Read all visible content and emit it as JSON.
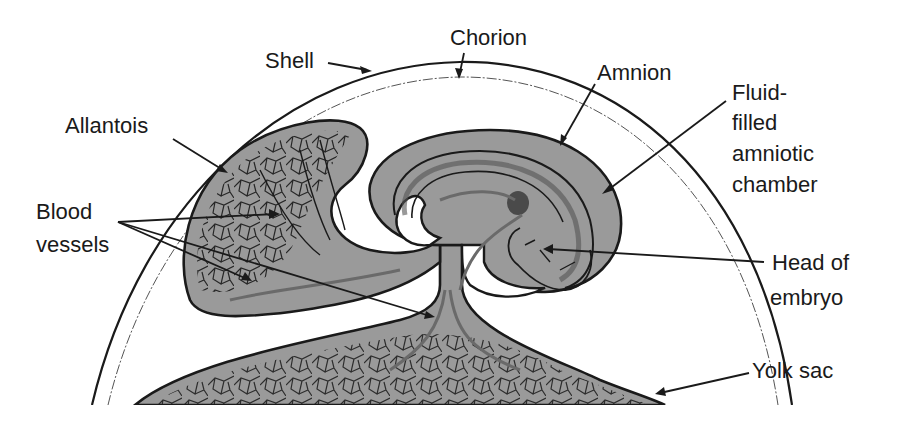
{
  "figure": {
    "colors": {
      "background": "#ffffff",
      "tissue": "#9a9a9a",
      "line": "#1a1a1a",
      "vessel_gray": "#6a6a6a"
    }
  },
  "labels": {
    "shell": "Shell",
    "chorion": "Chorion",
    "amnion": "Amnion",
    "allantois": "Allantois",
    "fluid_line1": "Fluid-",
    "fluid_line2": "filled",
    "fluid_line3": "amniotic",
    "fluid_line4": "chamber",
    "blood_line1": "Blood",
    "blood_line2": "vessels",
    "head_line1": "Head of",
    "head_line2": "embryo",
    "yolk_sac": "Yolk sac"
  }
}
